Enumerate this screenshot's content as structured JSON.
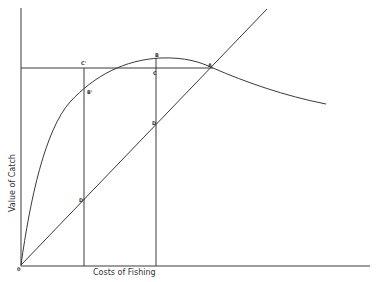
{
  "diagram": {
    "type": "economic-curve-diagram",
    "axes": {
      "x_label": "Costs of Fishing",
      "y_label": "Value of Catch",
      "origin_label": "0"
    },
    "curves": [
      {
        "name": "value-of-catch-curve",
        "description": "Sustainable yield curve rising from origin to a peak at B, then declining past A"
      },
      {
        "name": "cost-line",
        "description": "Straight line from origin through D', D and A"
      }
    ],
    "guide_lines": [
      {
        "name": "horizontal-line-c-prime-to-a",
        "description": "Horizontal line at the level of A through C' and C"
      },
      {
        "name": "vertical-line-c-prime-d-prime",
        "description": "Vertical line through C', B', D'"
      },
      {
        "name": "vertical-line-b-d",
        "description": "Vertical line through B, C, D"
      }
    ],
    "points": {
      "A": "A",
      "B": "B",
      "C": "C",
      "D": "D",
      "B_prime": "B'",
      "C_prime": "C'",
      "D_prime": "D'"
    }
  },
  "colors": {
    "line": "#3a3a3a",
    "background": "#ffffff"
  }
}
